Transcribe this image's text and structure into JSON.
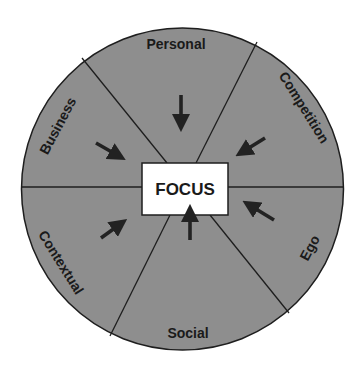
{
  "diagram": {
    "center_label": "FOCUS",
    "segments": [
      {
        "label": "Personal"
      },
      {
        "label": "Competition"
      },
      {
        "label": "Ego"
      },
      {
        "label": "Social"
      },
      {
        "label": "Contextual"
      },
      {
        "label": "Business"
      }
    ],
    "colors": {
      "wheel_fill": "#8e8e8e",
      "line": "#1e1e1e",
      "focus_fill": "#ffffff",
      "arrow": "#222222",
      "background": "#ffffff"
    }
  }
}
